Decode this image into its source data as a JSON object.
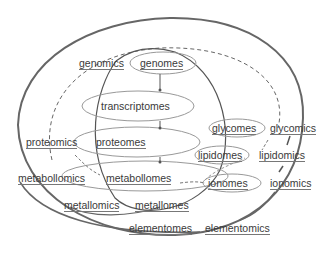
{
  "diagram": {
    "type": "omics-hierarchy-venn",
    "colors": {
      "stroke": "#555555",
      "light_stroke": "#999999",
      "text": "#3a3a3a",
      "background": "#ffffff"
    },
    "omes": [
      {
        "id": "genomes",
        "label": "genomes"
      },
      {
        "id": "transcriptomes",
        "label": "transcriptomes"
      },
      {
        "id": "proteomes",
        "label": "proteomes"
      },
      {
        "id": "metabollomes",
        "label": "metabollomes"
      },
      {
        "id": "glycomes",
        "label": "glycomes"
      },
      {
        "id": "lipidomes",
        "label": "lipidomes"
      },
      {
        "id": "ionomes",
        "label": "ionomes"
      },
      {
        "id": "metallomes",
        "label": "metallomes"
      },
      {
        "id": "elementomes",
        "label": "elementomes"
      }
    ],
    "omics": [
      {
        "id": "genomics",
        "label": "genomics"
      },
      {
        "id": "proteomics",
        "label": "proteomics"
      },
      {
        "id": "metabollomics",
        "label": "metabollomics"
      },
      {
        "id": "glycomics",
        "label": "glycomics"
      },
      {
        "id": "lipidomics",
        "label": "lipidomics"
      },
      {
        "id": "ionomics",
        "label": "ionomics"
      },
      {
        "id": "metallomics",
        "label": "metallomics"
      },
      {
        "id": "elementomics",
        "label": "elementomics"
      }
    ],
    "flow": [
      "genomes",
      "transcriptomes",
      "proteomes",
      "metabollomes"
    ]
  }
}
